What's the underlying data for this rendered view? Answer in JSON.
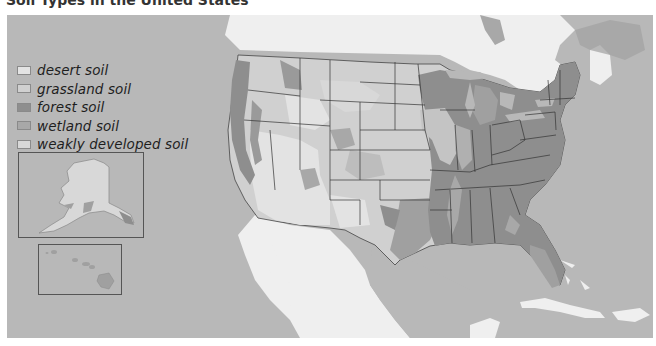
{
  "title": "Soil Types in the United States",
  "legend": {
    "items": [
      {
        "label": "desert soil",
        "color": "#e3e3e3"
      },
      {
        "label": "grassland soil",
        "color": "#d0d0d0"
      },
      {
        "label": "forest soil",
        "color": "#8e8e8e"
      },
      {
        "label": "wetland soil",
        "color": "#a8a8a8"
      },
      {
        "label": "weakly developed soil",
        "color": "#d8d8d8"
      }
    ]
  },
  "colors": {
    "water": "#b8b8b8",
    "foreign_land": "#efefef",
    "state_border": "#333333",
    "inset_border": "#555555"
  },
  "insets": [
    {
      "name": "Alaska"
    },
    {
      "name": "Hawaii"
    }
  ]
}
